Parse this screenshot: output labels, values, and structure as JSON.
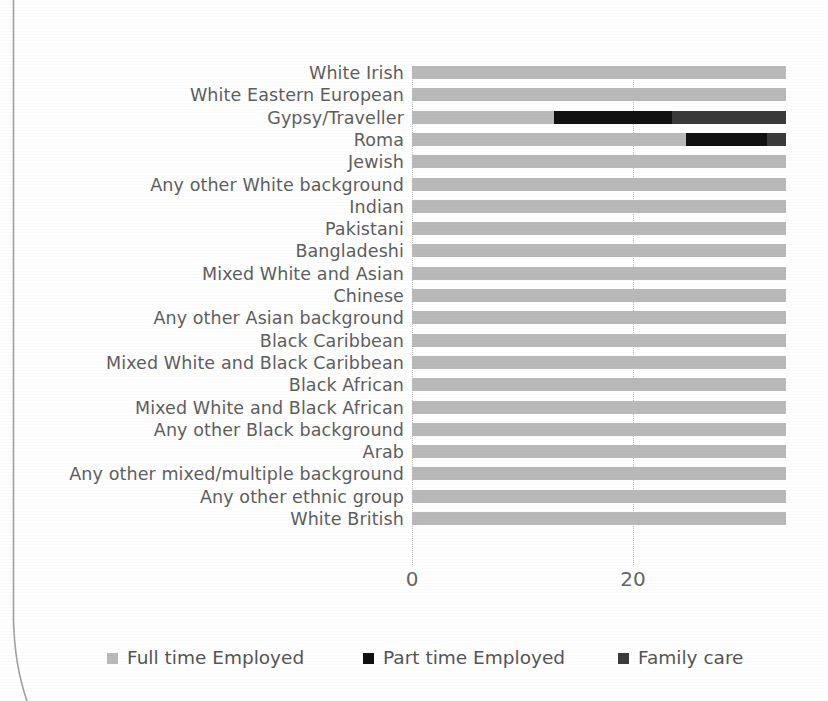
{
  "chart_data": {
    "type": "bar",
    "orientation": "horizontal",
    "stacked": true,
    "title": "",
    "subtitle": "",
    "xlabel": "",
    "ylabel": "",
    "xlim": [
      0,
      33.2
    ],
    "x_ticks": [
      0,
      20
    ],
    "x_tick_labels": [
      "0",
      "20"
    ],
    "grid": "vertical-dotted",
    "legend_position": "bottom",
    "categories": [
      "White Irish",
      "White Eastern European",
      "Gypsy/Traveller",
      "Roma",
      "Jewish",
      "Any other White background",
      "Indian",
      "Pakistani",
      "Bangladeshi",
      "Mixed White and Asian",
      "Chinese",
      "Any other Asian background",
      "Black Caribbean",
      "Mixed White and Black Caribbean",
      "Black African",
      "Mixed White and Black African",
      "Any other Black background",
      "Arab",
      "Any other mixed/multiple background",
      "Any other ethnic group",
      "White British"
    ],
    "series": [
      {
        "name": "Full time Employed",
        "color": "#b9b9b9",
        "values": [
          33.2,
          33.2,
          12.6,
          24.3,
          33.2,
          33.2,
          33.2,
          33.2,
          33.2,
          33.2,
          33.2,
          33.2,
          33.2,
          33.2,
          33.2,
          33.2,
          33.2,
          33.2,
          33.2,
          33.2,
          33.2
        ]
      },
      {
        "name": "Part time Employed",
        "color": "#111111",
        "values": [
          0,
          0,
          10.5,
          7.2,
          0,
          0,
          0,
          0,
          0,
          0,
          0,
          0,
          0,
          0,
          0,
          0,
          0,
          0,
          0,
          0,
          0
        ]
      },
      {
        "name": "Family care",
        "color": "#3b3b3b",
        "values": [
          0,
          0,
          10.1,
          1.7,
          0,
          0,
          0,
          0,
          0,
          0,
          0,
          0,
          0,
          0,
          0,
          0,
          0,
          0,
          0,
          0,
          0
        ]
      }
    ],
    "legend": [
      {
        "label": "Full time Employed",
        "color": "#b9b9b9"
      },
      {
        "label": "Part time Employed",
        "color": "#111111"
      },
      {
        "label": "Family care",
        "color": "#3b3b3b"
      }
    ]
  },
  "colors": {
    "full_time": "#b9b9b9",
    "part_time": "#111111",
    "family_care": "#3b3b3b",
    "label_text": "#5e5e5e",
    "axis_text": "#666666",
    "gridline": "#bdbdbd",
    "page_edge": "#8c8c8c"
  },
  "layout": {
    "plot_left_px": 412,
    "plot_right_px": 786,
    "plot_top_px": 66,
    "row_pitch_px": 22.3,
    "bar_height_px": 13,
    "x_tick_px": [
      412,
      633
    ],
    "legend_x_px": [
      107,
      363,
      618
    ],
    "units_per_px": 0.0905
  }
}
